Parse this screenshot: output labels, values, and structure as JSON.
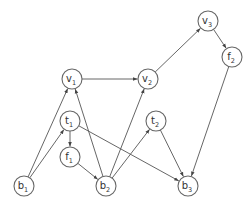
{
  "diagram": {
    "type": "directed-graph",
    "node_radius": 10,
    "colors": {
      "edge": "#555555",
      "node_stroke": "#666666",
      "node_fill": "#ffffff",
      "text": "#333333"
    },
    "nodes": [
      {
        "id": "v1",
        "base": "v",
        "sub": "1",
        "x": 72,
        "y": 79
      },
      {
        "id": "v2",
        "base": "v",
        "sub": "2",
        "x": 148,
        "y": 79
      },
      {
        "id": "v3",
        "base": "v",
        "sub": "3",
        "x": 208,
        "y": 21
      },
      {
        "id": "f2",
        "base": "f",
        "sub": "2",
        "x": 232,
        "y": 57
      },
      {
        "id": "t1",
        "base": "t",
        "sub": "1",
        "x": 70,
        "y": 121
      },
      {
        "id": "f1",
        "base": "f",
        "sub": "1",
        "x": 70,
        "y": 157
      },
      {
        "id": "t2",
        "base": "t",
        "sub": "2",
        "x": 156,
        "y": 121
      },
      {
        "id": "b1",
        "base": "b",
        "sub": "1",
        "x": 24,
        "y": 186
      },
      {
        "id": "b2",
        "base": "b",
        "sub": "2",
        "x": 106,
        "y": 186
      },
      {
        "id": "b3",
        "base": "b",
        "sub": "3",
        "x": 188,
        "y": 186
      }
    ],
    "edges": [
      {
        "from": "b1",
        "to": "v1"
      },
      {
        "from": "b1",
        "to": "t1"
      },
      {
        "from": "t1",
        "to": "f1"
      },
      {
        "from": "t1",
        "to": "b3"
      },
      {
        "from": "f1",
        "to": "b2"
      },
      {
        "from": "b2",
        "to": "v1"
      },
      {
        "from": "b2",
        "to": "v2"
      },
      {
        "from": "b2",
        "to": "t2"
      },
      {
        "from": "v1",
        "to": "v2"
      },
      {
        "from": "v2",
        "to": "v3"
      },
      {
        "from": "v3",
        "to": "f2"
      },
      {
        "from": "f2",
        "to": "b3"
      },
      {
        "from": "t2",
        "to": "b3"
      }
    ]
  }
}
